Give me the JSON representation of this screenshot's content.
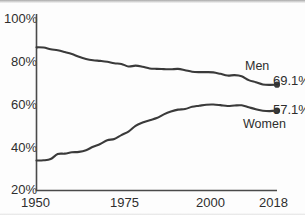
{
  "chart_data": {
    "type": "line",
    "title": "",
    "subtitle": "",
    "xlabel": "",
    "ylabel": "",
    "xlim": [
      1950,
      2018
    ],
    "ylim": [
      20,
      100
    ],
    "grid": false,
    "legend_position": "right-inline",
    "y_ticks": [
      "20%",
      "40%",
      "60%",
      "80%",
      "100%"
    ],
    "y_tick_values": [
      20,
      40,
      60,
      80,
      100
    ],
    "x_ticks": [
      "1950",
      "1975",
      "2000",
      "2018"
    ],
    "x_tick_values": [
      1950,
      1975,
      2000,
      2018
    ],
    "series": [
      {
        "name": "Men",
        "label": "Men",
        "end_value_label": "69.1%",
        "end_value": 69.1,
        "color": "#3a3a3a",
        "x": [
          1950,
          1952,
          1954,
          1956,
          1958,
          1960,
          1962,
          1964,
          1966,
          1968,
          1970,
          1972,
          1974,
          1976,
          1978,
          1980,
          1982,
          1984,
          1986,
          1988,
          1990,
          1992,
          1994,
          1996,
          1998,
          2000,
          2002,
          2004,
          2006,
          2008,
          2010,
          2012,
          2014,
          2016,
          2018
        ],
        "values": [
          86.4,
          86.3,
          85.5,
          85.0,
          84.2,
          83.3,
          82.0,
          81.0,
          80.4,
          80.1,
          79.7,
          79.0,
          78.7,
          77.5,
          77.9,
          77.4,
          76.6,
          76.4,
          76.3,
          76.2,
          76.4,
          75.8,
          75.1,
          74.9,
          74.9,
          74.8,
          74.1,
          73.3,
          73.5,
          73.0,
          71.2,
          70.2,
          69.2,
          69.0,
          69.1
        ]
      },
      {
        "name": "Women",
        "label": "Women",
        "end_value_label": "57.1%",
        "end_value": 57.1,
        "color": "#3a3a3a",
        "x": [
          1950,
          1952,
          1954,
          1956,
          1958,
          1960,
          1962,
          1964,
          1966,
          1968,
          1970,
          1972,
          1974,
          1976,
          1978,
          1980,
          1982,
          1984,
          1986,
          1988,
          1990,
          1992,
          1994,
          1996,
          1998,
          2000,
          2002,
          2004,
          2006,
          2008,
          2010,
          2012,
          2014,
          2016,
          2018
        ],
        "values": [
          33.9,
          34.0,
          34.6,
          36.9,
          37.1,
          37.7,
          37.9,
          38.7,
          40.3,
          41.6,
          43.3,
          43.9,
          45.7,
          47.3,
          50.0,
          51.5,
          52.6,
          53.6,
          55.3,
          56.6,
          57.5,
          57.8,
          58.8,
          59.3,
          59.8,
          59.9,
          59.6,
          59.2,
          59.4,
          59.5,
          58.6,
          57.7,
          57.0,
          56.8,
          57.1
        ]
      }
    ]
  },
  "axis": {
    "y_tick_100": "100%",
    "y_tick_80": "80%",
    "y_tick_60": "60%",
    "y_tick_40": "40%",
    "y_tick_20": "20%",
    "x_tick_1950": "1950",
    "x_tick_1975": "1975",
    "x_tick_2000": "2000",
    "x_tick_2018": "2018"
  },
  "annotations": {
    "men_label": "Men",
    "men_value": "69.1%",
    "women_label": "Women",
    "women_value": "57.1%"
  },
  "colors": {
    "line": "#3a3a3a",
    "axis": "#4a4a4a",
    "text": "#2e2e2e",
    "background": "#fdfdfd"
  }
}
